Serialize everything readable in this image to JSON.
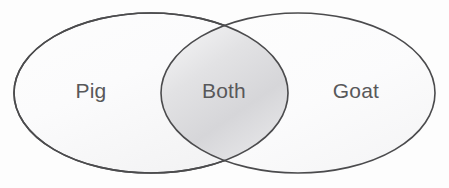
{
  "diagram": {
    "type": "venn",
    "title": "",
    "background_color": "#fdfdfd",
    "stroke_color": "#4b4b4d",
    "label_color": "#58585a",
    "sets": [
      {
        "id": "left-set",
        "label": "Pig",
        "region": "left-only",
        "label_x": 91,
        "label_y": 91,
        "center_x": 151,
        "center_y": 93,
        "rx": 137,
        "ry": 80
      },
      {
        "id": "right-set",
        "label": "Goat",
        "region": "right-only",
        "label_x": 356,
        "label_y": 91,
        "center_x": 298,
        "center_y": 93,
        "rx": 137,
        "ry": 80
      }
    ],
    "intersection": {
      "id": "intersection-set",
      "label": "Both",
      "region": "overlap",
      "label_x": 224,
      "label_y": 91,
      "fill_start": "#f6f6f7",
      "fill_mid": "#d8d8da",
      "fill_end": "#fbfbfb"
    }
  }
}
